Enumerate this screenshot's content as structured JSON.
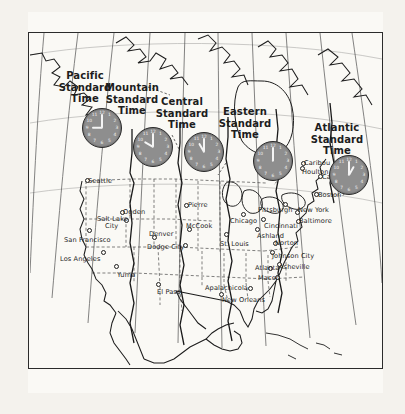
{
  "map": {
    "title": "North America Standard Time Zones",
    "background_color": "#faf9f5",
    "ink_color": "#2b2b2b",
    "clock_face_color": "#8e8e8e"
  },
  "longitude_top": [
    {
      "label": "150°",
      "x": 74
    },
    {
      "label": "130°",
      "x": 122
    },
    {
      "label": "120°",
      "x": 152
    },
    {
      "label": "105°",
      "x": 180
    },
    {
      "label": "90°",
      "x": 210
    },
    {
      "label": "75°",
      "x": 243
    },
    {
      "label": "60°",
      "x": 277
    },
    {
      "label": "45°",
      "x": 320
    }
  ],
  "longitude_bottom": [
    {
      "label": "120°",
      "x": 71
    },
    {
      "label": "105°",
      "x": 153
    },
    {
      "label": "90°",
      "x": 240
    },
    {
      "label": "75°",
      "x": 327
    }
  ],
  "time_zones": [
    {
      "id": "pacific",
      "name": "Pacific\nStandard\nTime",
      "label_x": 85,
      "label_y": 70,
      "clock_x": 82,
      "clock_y": 108,
      "clock_size": 38,
      "hour": 9,
      "minute": 0
    },
    {
      "id": "mountain",
      "name": "Mountain\nStandard\nTime",
      "label_x": 132,
      "label_y": 82,
      "clock_x": 133,
      "clock_y": 127,
      "clock_size": 38,
      "hour": 10,
      "minute": 0
    },
    {
      "id": "central",
      "name": "Central\nStandard\nTime",
      "label_x": 182,
      "label_y": 96,
      "clock_x": 184,
      "clock_y": 132,
      "clock_size": 38,
      "hour": 11,
      "minute": 0
    },
    {
      "id": "eastern",
      "name": "Eastern\nStandard\nTime",
      "label_x": 245,
      "label_y": 106,
      "clock_x": 253,
      "clock_y": 141,
      "clock_size": 38,
      "hour": 12,
      "minute": 0
    },
    {
      "id": "atlantic",
      "name": "Atlantic\nStandard\nTime",
      "label_x": 337,
      "label_y": 122,
      "clock_x": 329,
      "clock_y": 155,
      "clock_size": 38,
      "hour": 1,
      "minute": 0
    }
  ],
  "cities": [
    {
      "name": "Seattle",
      "label_x": 88,
      "label_y": 177,
      "dot_x": 85,
      "dot_y": 178
    },
    {
      "name": "Ogden",
      "label_x": 123,
      "label_y": 208,
      "dot_x": 120,
      "dot_y": 210
    },
    {
      "name": "Salt Lake",
      "label_x": 97,
      "label_y": 215,
      "dot_x": 124,
      "dot_y": 218
    },
    {
      "name": "City",
      "label_x": 105,
      "label_y": 222,
      "dot_x": -99,
      "dot_y": -99
    },
    {
      "name": "San Francisco",
      "label_x": 64,
      "label_y": 236,
      "dot_x": 87,
      "dot_y": 228
    },
    {
      "name": "Los Angeles",
      "label_x": 60,
      "label_y": 255,
      "dot_x": 101,
      "dot_y": 250
    },
    {
      "name": "Yuma",
      "label_x": 117,
      "label_y": 271,
      "dot_x": 114,
      "dot_y": 264
    },
    {
      "name": "Denver",
      "label_x": 149,
      "label_y": 230,
      "dot_x": 152,
      "dot_y": 235
    },
    {
      "name": "Dodge City",
      "label_x": 147,
      "label_y": 243,
      "dot_x": 183,
      "dot_y": 243
    },
    {
      "name": "Pierre",
      "label_x": 188,
      "label_y": 201,
      "dot_x": 184,
      "dot_y": 203
    },
    {
      "name": "McCook",
      "label_x": 186,
      "label_y": 222,
      "dot_x": 187,
      "dot_y": 227
    },
    {
      "name": "El Paso",
      "label_x": 157,
      "label_y": 288,
      "dot_x": 156,
      "dot_y": 282
    },
    {
      "name": "Chicago",
      "label_x": 230,
      "label_y": 217,
      "dot_x": 241,
      "dot_y": 212
    },
    {
      "name": "St. Louis",
      "label_x": 220,
      "label_y": 240,
      "dot_x": 224,
      "dot_y": 232
    },
    {
      "name": "Ashland",
      "label_x": 257,
      "label_y": 232,
      "dot_x": 255,
      "dot_y": 227
    },
    {
      "name": "Cincinnati",
      "label_x": 264,
      "label_y": 222,
      "dot_x": 261,
      "dot_y": 217
    },
    {
      "name": "Pittsburgh",
      "label_x": 258,
      "label_y": 206,
      "dot_x": 283,
      "dot_y": 202
    },
    {
      "name": "New York",
      "label_x": 298,
      "label_y": 206,
      "dot_x": 295,
      "dot_y": 210
    },
    {
      "name": "Baltimore",
      "label_x": 299,
      "label_y": 217,
      "dot_x": 296,
      "dot_y": 219
    },
    {
      "name": "Boston",
      "label_x": 318,
      "label_y": 191,
      "dot_x": 314,
      "dot_y": 192
    },
    {
      "name": "Calais",
      "label_x": 322,
      "label_y": 173,
      "dot_x": 318,
      "dot_y": 174
    },
    {
      "name": "Houlton",
      "label_x": 302,
      "label_y": 168,
      "dot_x": 300,
      "dot_y": 166
    },
    {
      "name": "Caribou",
      "label_x": 304,
      "label_y": 159,
      "dot_x": 301,
      "dot_y": 161
    },
    {
      "name": "Norton",
      "label_x": 275,
      "label_y": 239,
      "dot_x": 273,
      "dot_y": 241
    },
    {
      "name": "Johnson City",
      "label_x": 272,
      "label_y": 252,
      "dot_x": 270,
      "dot_y": 250
    },
    {
      "name": "Asheville",
      "label_x": 279,
      "label_y": 263,
      "dot_x": 277,
      "dot_y": 262
    },
    {
      "name": "Atlanta",
      "label_x": 255,
      "label_y": 264,
      "dot_x": 268,
      "dot_y": 266
    },
    {
      "name": "Macon",
      "label_x": 258,
      "label_y": 274,
      "dot_x": 275,
      "dot_y": 275
    },
    {
      "name": "Apalachicola",
      "label_x": 205,
      "label_y": 284,
      "dot_x": 248,
      "dot_y": 286
    },
    {
      "name": "New Orleans",
      "label_x": 222,
      "label_y": 296,
      "dot_x": 219,
      "dot_y": 292
    }
  ]
}
